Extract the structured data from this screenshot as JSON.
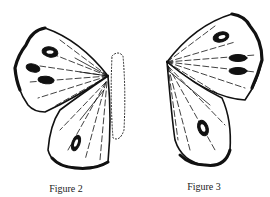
{
  "figures": [
    {
      "id": "fig2",
      "caption": "Figure 2",
      "subject": "butterfly-wings-left-with-dotted-body-outline"
    },
    {
      "id": "fig3",
      "caption": "Figure 3",
      "subject": "butterfly-wings-right"
    }
  ],
  "colors": {
    "ink": "#111111",
    "background": "#ffffff",
    "caption": "#222222"
  }
}
